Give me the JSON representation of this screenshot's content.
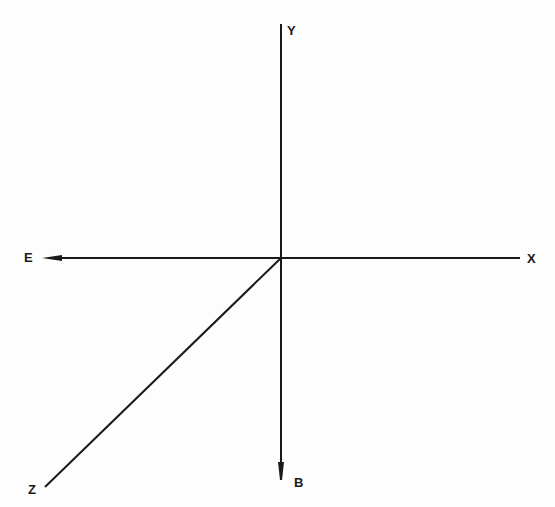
{
  "diagram": {
    "type": "coordinate-axes",
    "origin": {
      "x": 281,
      "y": 258
    },
    "line_color": "#1a1a1a",
    "background": "#fdfdfd",
    "axes": [
      {
        "id": "y",
        "label": "Y",
        "direction": "up",
        "end": {
          "x": 281,
          "y": 24
        },
        "arrow": false
      },
      {
        "id": "b",
        "label": "B",
        "direction": "down",
        "end": {
          "x": 281,
          "y": 478
        },
        "arrow": true
      },
      {
        "id": "e",
        "label": "E",
        "direction": "left",
        "end": {
          "x": 45,
          "y": 258
        },
        "arrow": true
      },
      {
        "id": "x",
        "label": "X",
        "direction": "right",
        "end": {
          "x": 520,
          "y": 258
        },
        "arrow": false
      },
      {
        "id": "z",
        "label": "Z",
        "direction": "down-left",
        "end": {
          "x": 45,
          "y": 487
        },
        "arrow": false
      }
    ]
  }
}
